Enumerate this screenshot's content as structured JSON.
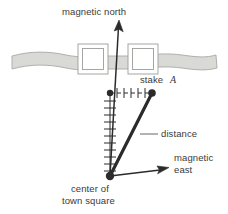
{
  "figure": {
    "type": "surveying-diagram",
    "title_text": "",
    "labels": {
      "magnetic_north": "magnetic north",
      "stake_a_prefix": "stake ",
      "stake_a_letter": "A",
      "distance": "distance",
      "magnetic_east_line1": "magnetic",
      "magnetic_east_line2": "east",
      "center_line1": "center of",
      "center_line2": "town square"
    },
    "colors": {
      "ink": "#3a3a3a",
      "line_dark": "#2b2b2b",
      "band_fill": "#d9d9d6",
      "band_stroke": "#a8a8a6",
      "building_stroke": "#9c9c9a",
      "building_fill": "#ffffff",
      "background": "#ffffff",
      "thin_line": "#555555"
    },
    "geometry": {
      "center_node": {
        "x": 110,
        "y": 176
      },
      "north_arrow_tip": {
        "x": 119,
        "y": 21
      },
      "north_scale_top": {
        "x": 110,
        "y": 93
      },
      "stake_a_node": {
        "x": 152,
        "y": 93
      },
      "east_arrow_tip": {
        "x": 168,
        "y": 168
      },
      "band_y": 62,
      "tick_count_vertical": 11,
      "tick_count_horizontal": 6
    },
    "elements": [
      "magnetic-north-arrow",
      "vertical-tick-scale",
      "horizontal-dashed-tick-line",
      "distance-segment",
      "magnetic-east-arrow",
      "road-band",
      "building-square-left",
      "building-square-right",
      "center-node-dot",
      "stake-node-dot",
      "scale-top-node-dot",
      "distance-leader-line"
    ]
  }
}
